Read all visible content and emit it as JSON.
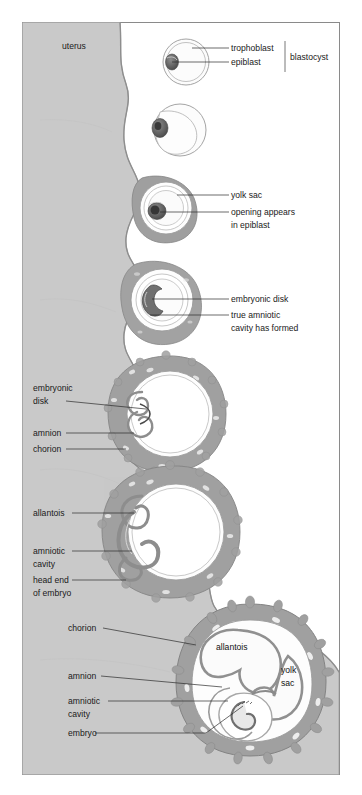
{
  "figure": {
    "title_region": "uterus",
    "frame": {
      "x": 22,
      "y": 22,
      "width": 318,
      "height": 753,
      "border_color": "#8a8a8a"
    },
    "background_color": "#ffffff",
    "uterus_fill": "#c9c9c9",
    "endometrium_fill": "#b4b4b4",
    "trophoblast_fill": "#9a9a9a",
    "cavity_fill": "#fbfbfb",
    "inner_mass_fill": "#6b6b6b"
  },
  "labels": {
    "uterus": "uterus",
    "trophoblast": "trophoblast",
    "epiblast": "epiblast",
    "blastocyst": "blastocyst",
    "yolk_sac": "yolk sac",
    "opening_line1": "opening appears",
    "opening_line2": "in epiblast",
    "embryonic_disk": "embryonic disk",
    "true_amniotic_line1": "true amniotic",
    "true_amniotic_line2": "cavity has formed",
    "embryonic_line1": "embryonic",
    "embryonic_line2": "disk",
    "amnion": "amnion",
    "chorion": "chorion",
    "allantois": "allantois",
    "amniotic_line1": "amniotic",
    "amniotic_line2": "cavity",
    "head_end_line1": "head end",
    "head_end_line2": "of embryo",
    "chorion_b": "chorion",
    "amnion_b": "amnion",
    "amniotic_b_line1": "amniotic",
    "amniotic_b_line2": "cavity",
    "embryo": "embryo",
    "allantois_inline": "allantois",
    "yolk_inline_line1": "yolk",
    "yolk_inline_line2": "sac"
  },
  "stages": [
    {
      "name": "blastocyst-free-floating",
      "cx": 186,
      "cy": 62,
      "r": 23
    },
    {
      "name": "blastocyst-attaching",
      "cx": 178,
      "cy": 130,
      "r": 26
    },
    {
      "name": "yolk-sac-forming",
      "cx": 166,
      "cy": 208,
      "r": 32
    },
    {
      "name": "amniotic-cavity-formed",
      "cx": 162,
      "cy": 298,
      "r": 36
    },
    {
      "name": "embryonic-disk-amnion-chorion",
      "cx": 166,
      "cy": 412,
      "r": 51
    },
    {
      "name": "allantois-head-end",
      "cx": 170,
      "cy": 530,
      "r": 58
    },
    {
      "name": "full-embryo-allantois-yolk",
      "cx": 250,
      "cy": 680,
      "r": 74
    }
  ]
}
